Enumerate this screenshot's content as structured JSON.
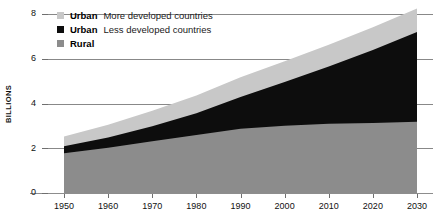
{
  "chart_data": {
    "type": "area",
    "title": "",
    "subtitle": "",
    "xlabel": "",
    "ylabel": "BILLIONS",
    "stacked": true,
    "grid": true,
    "legend_position": "top-left",
    "x": [
      1950,
      1960,
      1970,
      1980,
      1990,
      2000,
      2010,
      2020,
      2030
    ],
    "xtick_labels": [
      "1950",
      "1960",
      "1970",
      "1980",
      "1990",
      "2000",
      "2010",
      "2020",
      "2030"
    ],
    "xlim": [
      1950,
      2030
    ],
    "ytick_labels": [
      "0",
      "2",
      "4",
      "6",
      "8"
    ],
    "yticks": [
      0,
      2,
      4,
      6,
      8
    ],
    "ylim": [
      0,
      8
    ],
    "series": [
      {
        "name": "Rural",
        "label_key": "Rural",
        "label_desc": "",
        "color": "#8c8c8c",
        "values": [
          1.78,
          2.02,
          2.31,
          2.59,
          2.87,
          3.01,
          3.09,
          3.13,
          3.18
        ]
      },
      {
        "name": "Urban Less developed countries",
        "label_key": "Urban",
        "label_desc": "Less developed countries",
        "color": "#0d0d0d",
        "values": [
          0.31,
          0.46,
          0.67,
          0.97,
          1.42,
          1.95,
          2.56,
          3.26,
          4.02
        ]
      },
      {
        "name": "Urban More developed countries",
        "label_key": "Urban",
        "label_desc": "More developed countries",
        "color": "#c8c8c8",
        "values": [
          0.44,
          0.57,
          0.7,
          0.8,
          0.88,
          0.93,
          0.98,
          1.02,
          1.05
        ]
      }
    ],
    "totals": [
      2.53,
      3.05,
      3.68,
      4.36,
      5.17,
      5.89,
      6.63,
      7.41,
      8.25
    ]
  },
  "legend": {
    "items": [
      {
        "swatch_color": "#c8c8c8",
        "key": "Urban",
        "desc": "More developed countries"
      },
      {
        "swatch_color": "#0d0d0d",
        "key": "Urban",
        "desc": "Less developed countries"
      },
      {
        "swatch_color": "#8c8c8c",
        "key": "Rural",
        "desc": ""
      }
    ]
  },
  "axis": {
    "y_title": "BILLIONS"
  }
}
